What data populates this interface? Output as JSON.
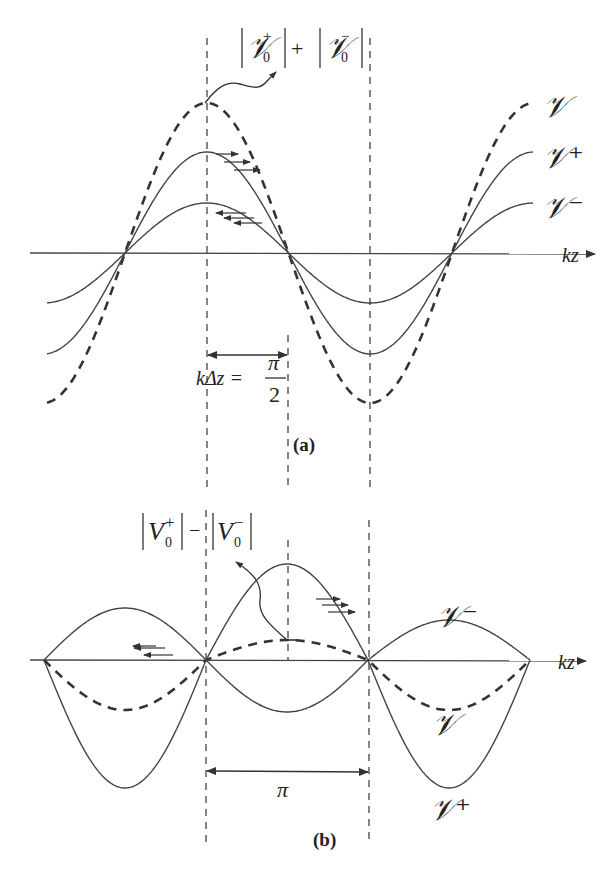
{
  "figure": {
    "panel_a": {
      "caption": "(a)",
      "top_formula": {
        "left_symbol": "𝒱",
        "left_sub": "0",
        "left_sup": "+",
        "operator": "+",
        "right_symbol": "𝒱",
        "right_sub": "0",
        "right_sup": "−"
      },
      "axis_label": "kz",
      "curve_labels": {
        "total": "𝒱",
        "forward": "𝒱⁺",
        "backward": "𝒱⁻"
      },
      "spacing_label": {
        "lhs": "kΔz =",
        "numerator": "π",
        "denominator": "2"
      }
    },
    "panel_b": {
      "caption": "(b)",
      "top_formula": {
        "left_symbol": "V",
        "left_sub": "0",
        "left_sup": "+",
        "operator": "−",
        "right_symbol": "V",
        "right_sub": "0",
        "right_sup": "−"
      },
      "axis_label": "kz",
      "curve_labels": {
        "total": "𝒱",
        "forward": "𝒱⁺",
        "backward": "𝒱⁻"
      },
      "spacing_label": "π"
    },
    "colors": {
      "line": "#3a3a3a",
      "text": "#222222",
      "background": "#ffffff"
    }
  }
}
